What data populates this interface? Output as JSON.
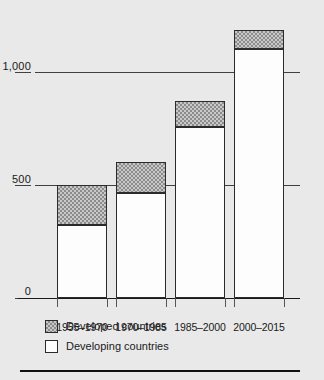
{
  "chart_data": {
    "type": "bar",
    "title": "",
    "subtitle": "",
    "xlabel": "",
    "ylabel": "",
    "stacked": true,
    "grid": true,
    "legend_position": "bottom-left",
    "categories": [
      "1955–1970",
      "1970–1985",
      "1985–2000",
      "2000–2015"
    ],
    "ylim": [
      0,
      1250
    ],
    "yticks": [
      0,
      500,
      1000
    ],
    "ytick_labels": [
      "0",
      "500",
      "1,000"
    ],
    "series": [
      {
        "name": "Developing countries",
        "swatch": "white",
        "values": [
          325,
          465,
          755,
          1100
        ]
      },
      {
        "name": "Developed countries",
        "swatch": "hatched-gray",
        "values": [
          175,
          135,
          115,
          85
        ]
      }
    ],
    "totals": [
      500,
      600,
      870,
      1185
    ]
  },
  "axes": {
    "y": {
      "ticks": [
        {
          "label": "1,000",
          "value": 1000
        },
        {
          "label": "500",
          "value": 500
        },
        {
          "label": "0",
          "value": 0
        }
      ]
    },
    "x": {
      "ticks": [
        {
          "label": "1955–1970"
        },
        {
          "label": "1970–1985"
        },
        {
          "label": "1985–2000"
        },
        {
          "label": "2000–2015"
        }
      ]
    }
  },
  "legend": {
    "items": [
      {
        "label": "Developed countries",
        "swatch": "developed"
      },
      {
        "label": "Developing countries",
        "swatch": "developing"
      }
    ]
  },
  "colors": {
    "background": "#e9e9e9",
    "axis": "#1a1a1a",
    "grid": "#404040",
    "developed_fill": "#c8c8c8",
    "developed_pattern": "#8c8c8c",
    "developing_fill": "#fdfdfd",
    "bar_outline": "#2b2b2b",
    "rule": "#111111"
  }
}
